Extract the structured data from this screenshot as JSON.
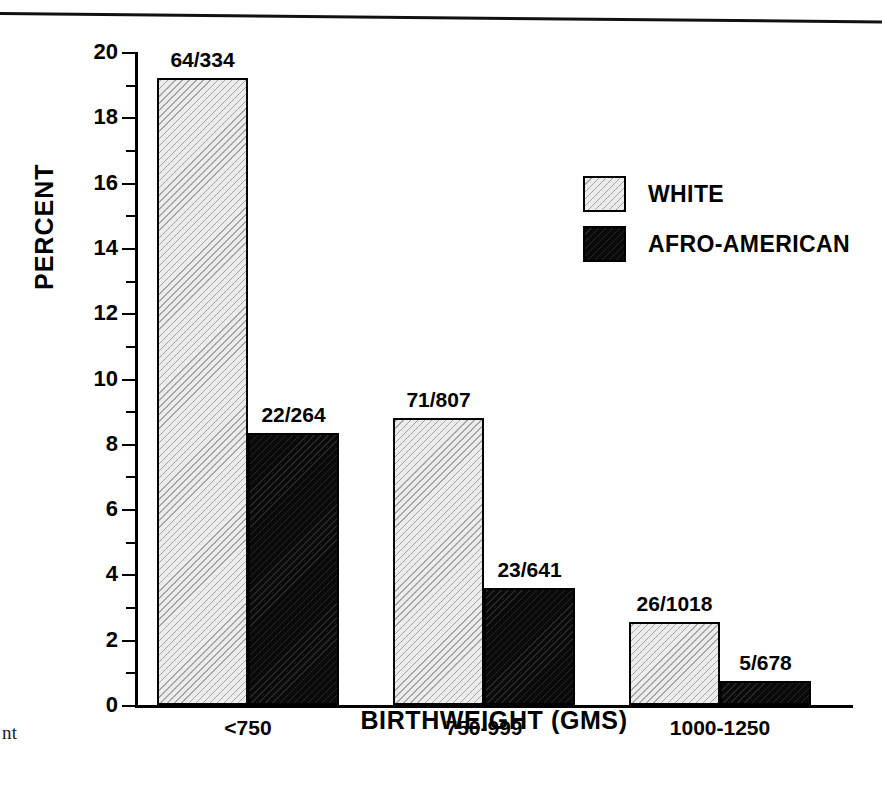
{
  "page": {
    "caption_fragment": "nt",
    "rule_color": "#111111"
  },
  "chart_data": {
    "type": "bar",
    "title": "",
    "xlabel": "BIRTHWEIGHT (GMS)",
    "ylabel": "PERCENT",
    "ylim": [
      0,
      20
    ],
    "ytick_major": [
      0,
      2,
      4,
      6,
      8,
      10,
      12,
      14,
      16,
      18,
      20
    ],
    "ytick_minor": [
      1,
      3,
      5,
      7,
      9,
      11,
      13,
      15,
      17,
      19
    ],
    "ytick_labels": [
      "0",
      "2",
      "4",
      "6",
      "8",
      "10",
      "12",
      "14",
      "16",
      "18",
      "20"
    ],
    "grid": false,
    "legend_position": "upper right",
    "categories": [
      "<750",
      "750-999",
      "1000-1250"
    ],
    "series": [
      {
        "name": "WHITE",
        "color": "#ececec",
        "pattern": "diagonal-hatch-light",
        "values": [
          19.2,
          8.8,
          2.55
        ],
        "labels": [
          "64/334",
          "71/807",
          "26/1018"
        ],
        "numerators": [
          64,
          71,
          26
        ],
        "denominators": [
          334,
          807,
          1018
        ]
      },
      {
        "name": "AFRO-AMERICAN",
        "color": "#0a0a0a",
        "pattern": "solid-black-hatch",
        "values": [
          8.33,
          3.59,
          0.74
        ],
        "labels": [
          "22/264",
          "23/641",
          "5/678"
        ],
        "numerators": [
          22,
          23,
          5
        ],
        "denominators": [
          264,
          641,
          678
        ]
      }
    ]
  },
  "legend": {
    "entries": [
      {
        "label": "WHITE"
      },
      {
        "label": "AFRO-AMERICAN"
      }
    ]
  }
}
